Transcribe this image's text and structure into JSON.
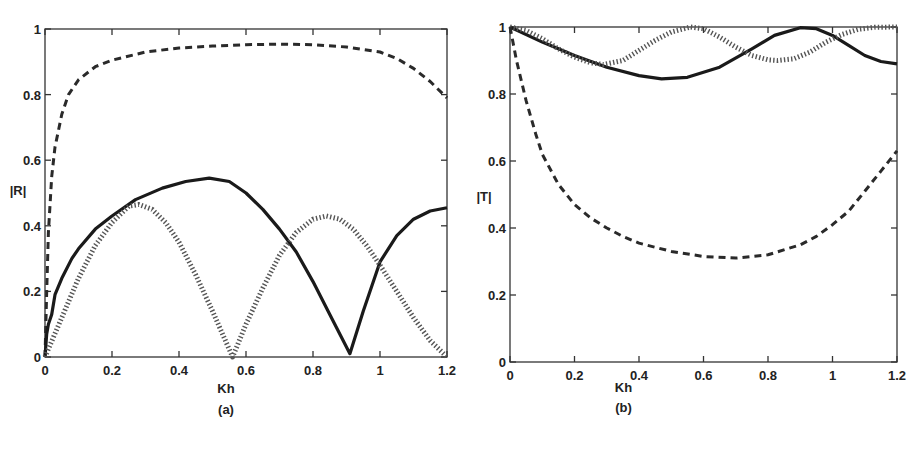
{
  "chart_data": [
    {
      "type": "line",
      "panel_label": "(a)",
      "title": "",
      "xlabel": "Kh",
      "ylabel": "|R|",
      "xlim": [
        0,
        1.2
      ],
      "ylim": [
        0,
        1
      ],
      "xticks": [
        "0",
        "0.2",
        "0.4",
        "0.6",
        "0.8",
        "1",
        "1.2"
      ],
      "yticks": [
        "0",
        "0.2",
        "0.4",
        "0.6",
        "0.8",
        "1"
      ],
      "grid": false,
      "legend": null,
      "series": [
        {
          "name": "dashed",
          "style": "dashed",
          "x": [
            0,
            0.005,
            0.01,
            0.02,
            0.03,
            0.05,
            0.07,
            0.1,
            0.15,
            0.2,
            0.3,
            0.4,
            0.5,
            0.6,
            0.7,
            0.8,
            0.9,
            1.0,
            1.05,
            1.1,
            1.15,
            1.2
          ],
          "values": [
            0,
            0.2,
            0.38,
            0.55,
            0.64,
            0.74,
            0.8,
            0.845,
            0.885,
            0.905,
            0.93,
            0.942,
            0.948,
            0.952,
            0.954,
            0.952,
            0.945,
            0.93,
            0.91,
            0.88,
            0.84,
            0.79
          ]
        },
        {
          "name": "solid",
          "style": "solid",
          "x": [
            0,
            0.005,
            0.01,
            0.02,
            0.03,
            0.05,
            0.08,
            0.1,
            0.15,
            0.2,
            0.27,
            0.35,
            0.42,
            0.49,
            0.55,
            0.6,
            0.65,
            0.7,
            0.75,
            0.8,
            0.85,
            0.91,
            0.95,
            1.0,
            1.05,
            1.1,
            1.15,
            1.2
          ],
          "values": [
            0,
            0.07,
            0.1,
            0.13,
            0.19,
            0.24,
            0.3,
            0.33,
            0.39,
            0.43,
            0.48,
            0.515,
            0.535,
            0.545,
            0.535,
            0.5,
            0.45,
            0.39,
            0.32,
            0.23,
            0.13,
            0.01,
            0.14,
            0.29,
            0.37,
            0.42,
            0.445,
            0.455
          ]
        },
        {
          "name": "dotted",
          "style": "dotted",
          "x": [
            0,
            0.05,
            0.1,
            0.15,
            0.2,
            0.25,
            0.28,
            0.32,
            0.36,
            0.4,
            0.45,
            0.5,
            0.56,
            0.6,
            0.65,
            0.7,
            0.75,
            0.8,
            0.84,
            0.88,
            0.92,
            0.96,
            1.0,
            1.05,
            1.1,
            1.15,
            1.2
          ],
          "values": [
            0,
            0.12,
            0.24,
            0.34,
            0.41,
            0.46,
            0.465,
            0.45,
            0.41,
            0.35,
            0.25,
            0.14,
            0.0,
            0.1,
            0.21,
            0.31,
            0.38,
            0.42,
            0.43,
            0.42,
            0.39,
            0.34,
            0.28,
            0.2,
            0.12,
            0.05,
            0.0
          ]
        }
      ]
    },
    {
      "type": "line",
      "panel_label": "(b)",
      "title": "",
      "xlabel": "Kh",
      "ylabel": "|T|",
      "xlim": [
        0,
        1.2
      ],
      "ylim": [
        0,
        1
      ],
      "xticks": [
        "0",
        "0.2",
        "0.4",
        "0.6",
        "0.8",
        "1",
        "1.2"
      ],
      "yticks": [
        "0",
        "0.2",
        "0.4",
        "0.6",
        "0.8",
        "1"
      ],
      "grid": false,
      "legend": null,
      "series": [
        {
          "name": "solid",
          "style": "solid",
          "x": [
            0,
            0.1,
            0.2,
            0.3,
            0.4,
            0.47,
            0.55,
            0.65,
            0.75,
            0.82,
            0.9,
            0.95,
            1.0,
            1.05,
            1.1,
            1.15,
            1.2
          ],
          "values": [
            1.0,
            0.955,
            0.915,
            0.88,
            0.855,
            0.845,
            0.85,
            0.88,
            0.935,
            0.975,
            0.998,
            0.995,
            0.975,
            0.945,
            0.915,
            0.897,
            0.89
          ]
        },
        {
          "name": "dotted",
          "style": "dotted",
          "x": [
            0,
            0.05,
            0.1,
            0.15,
            0.2,
            0.25,
            0.29,
            0.35,
            0.4,
            0.45,
            0.5,
            0.56,
            0.6,
            0.65,
            0.7,
            0.75,
            0.8,
            0.83,
            0.88,
            0.93,
            0.98,
            1.03,
            1.08,
            1.13,
            1.2
          ],
          "values": [
            1.0,
            0.99,
            0.965,
            0.935,
            0.91,
            0.893,
            0.888,
            0.9,
            0.93,
            0.96,
            0.985,
            1.0,
            0.995,
            0.97,
            0.94,
            0.915,
            0.902,
            0.9,
            0.905,
            0.925,
            0.955,
            0.978,
            0.993,
            0.999,
            1.0
          ]
        },
        {
          "name": "dashed",
          "style": "dashed",
          "x": [
            0,
            0.02,
            0.05,
            0.08,
            0.1,
            0.15,
            0.2,
            0.25,
            0.3,
            0.35,
            0.4,
            0.5,
            0.6,
            0.7,
            0.8,
            0.9,
            0.95,
            1.0,
            1.05,
            1.1,
            1.15,
            1.2
          ],
          "values": [
            1.0,
            0.9,
            0.78,
            0.68,
            0.62,
            0.53,
            0.47,
            0.43,
            0.4,
            0.375,
            0.355,
            0.33,
            0.315,
            0.31,
            0.32,
            0.35,
            0.375,
            0.41,
            0.45,
            0.51,
            0.57,
            0.63
          ]
        }
      ]
    }
  ]
}
